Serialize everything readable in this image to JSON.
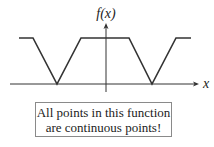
{
  "diagram": {
    "y_axis_label": "f(x)",
    "x_axis_label": "x",
    "function_polyline": [
      [
        19,
        38
      ],
      [
        33,
        38
      ],
      [
        57,
        84
      ],
      [
        81,
        38
      ],
      [
        129,
        38
      ],
      [
        152,
        84
      ],
      [
        176,
        38
      ],
      [
        191,
        38
      ]
    ],
    "note": {
      "line1": "All points in this function",
      "line2": "are continuous points!"
    },
    "colors": {
      "curve": "#333333",
      "axis": "#333333",
      "box_border": "#8a8a8a"
    }
  }
}
